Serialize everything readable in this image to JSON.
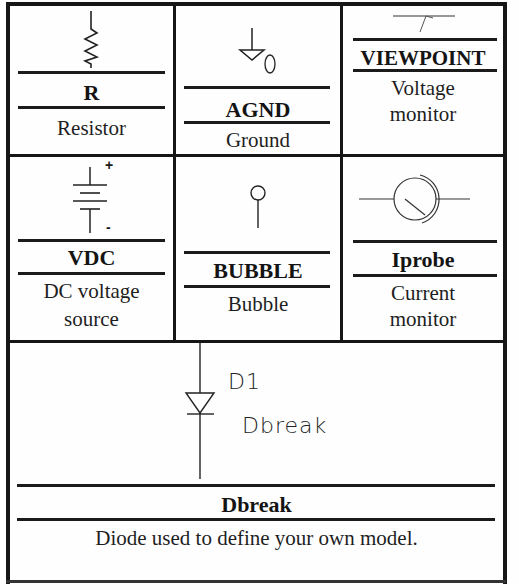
{
  "cells": [
    {
      "part": "R",
      "description": [
        "Resistor"
      ],
      "symbol": "resistor-icon"
    },
    {
      "part": "AGND",
      "description": [
        "Ground"
      ],
      "symbol": "ground-icon",
      "symbol_label": "0"
    },
    {
      "part": "VIEWPOINT",
      "description": [
        "Voltage",
        "monitor"
      ],
      "symbol": "viewpoint-icon"
    },
    {
      "part": "VDC",
      "description": [
        "DC voltage",
        "source"
      ],
      "symbol": "battery-icon",
      "plus": "+",
      "minus": "-"
    },
    {
      "part": "BUBBLE",
      "description": [
        "Bubble"
      ],
      "symbol": "bubble-icon"
    },
    {
      "part": "Iprobe",
      "description": [
        "Current",
        "monitor"
      ],
      "symbol": "ammeter-icon"
    },
    {
      "part": "Dbreak",
      "description": [
        "Diode used to define your own model."
      ],
      "symbol": "diode-icon",
      "ref_designator": "D1",
      "model_label": "Dbreak"
    }
  ],
  "colors": {
    "line": "#1b1b1b",
    "background": "#fefefe"
  }
}
